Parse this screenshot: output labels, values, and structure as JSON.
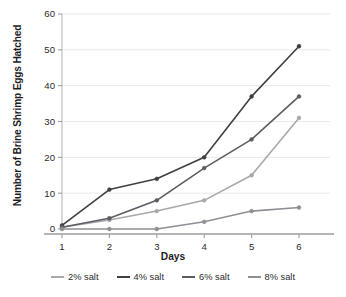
{
  "chart_data": {
    "type": "line",
    "title": "",
    "xlabel": "Days",
    "ylabel": "Number of Brine Shrimp Eggs Hatched",
    "x": [
      1,
      2,
      3,
      4,
      5,
      6
    ],
    "xticklabels": [
      "1",
      "2",
      "3",
      "4",
      "5",
      "6"
    ],
    "yticklabels": [
      "0",
      "10",
      "20",
      "30",
      "40",
      "50",
      "60"
    ],
    "yticks": [
      0,
      10,
      20,
      30,
      40,
      50,
      60
    ],
    "xlim": [
      1,
      6
    ],
    "ylim": [
      0,
      60
    ],
    "grid": "horizontal",
    "legend_position": "bottom",
    "markers": "circle",
    "series": [
      {
        "name": "2% salt",
        "color": "#a8a8ad",
        "values": [
          0.5,
          2.5,
          5,
          8,
          15,
          31
        ]
      },
      {
        "name": "4% salt",
        "color": "#3f3f44",
        "values": [
          1,
          11,
          14,
          20,
          37,
          51
        ]
      },
      {
        "name": "6% salt",
        "color": "#5c5c62",
        "values": [
          0.5,
          3,
          8,
          17,
          25,
          37
        ]
      },
      {
        "name": "8% salt",
        "color": "#8e8e94",
        "values": [
          0,
          0,
          0,
          2,
          5,
          6
        ]
      }
    ]
  },
  "legend": {
    "items": [
      {
        "label": "2% salt"
      },
      {
        "label": "4% salt"
      },
      {
        "label": "6% salt"
      },
      {
        "label": "8% salt"
      }
    ]
  },
  "axes": {
    "x_title": "Days",
    "y_title": "Number of Brine Shrimp Eggs Hatched"
  }
}
